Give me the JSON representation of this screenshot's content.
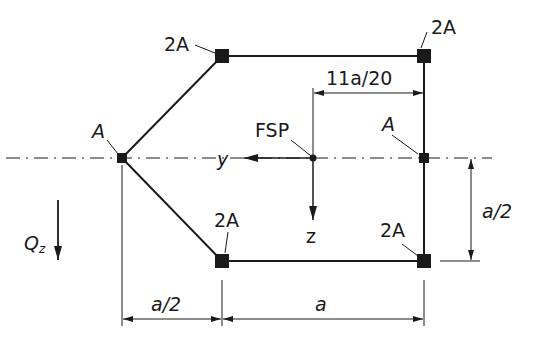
{
  "diagram": {
    "type": "cross-section-stringer-idealization",
    "labels": {
      "top_left_area": "2A",
      "top_right_area": "2A",
      "left_area": "A",
      "right_mid_area": "A",
      "bottom_left_area": "2A",
      "bottom_right_area": "2A",
      "centroid": "FSP",
      "axis_y": "y",
      "axis_z": "z",
      "shear_force": "Q",
      "shear_force_subscript": "z"
    },
    "dimensions": {
      "shear_center_offset": "11a/20",
      "height_half": "a/2",
      "bottom_left_width": "a/2",
      "bottom_width": "a"
    },
    "colors": {
      "line": "#1a1a1a",
      "background": "#ffffff"
    }
  }
}
